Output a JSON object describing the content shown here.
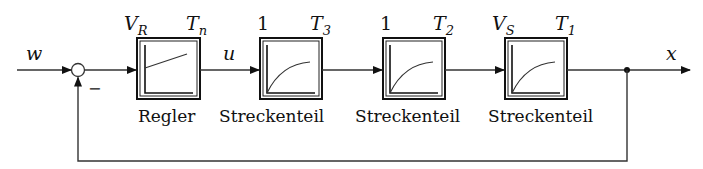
{
  "signals": {
    "input": "w",
    "controller_output": "u",
    "output": "x",
    "feedback_sign": "−"
  },
  "blocks": [
    {
      "id": "regler",
      "label": "Regler",
      "param_left": "V",
      "param_left_sub": "R",
      "param_right": "T",
      "param_right_sub": "n",
      "response": "pi-ramp"
    },
    {
      "id": "strecke-3",
      "label": "Streckenteil",
      "param_left": "1",
      "param_left_sub": "",
      "param_right": "T",
      "param_right_sub": "3",
      "response": "pt1"
    },
    {
      "id": "strecke-2",
      "label": "Streckenteil",
      "param_left": "1",
      "param_left_sub": "",
      "param_right": "T",
      "param_right_sub": "2",
      "response": "pt1"
    },
    {
      "id": "strecke-1",
      "label": "Streckenteil",
      "param_left": "V",
      "param_left_sub": "S",
      "param_right": "T",
      "param_right_sub": "1",
      "response": "pt1"
    }
  ]
}
